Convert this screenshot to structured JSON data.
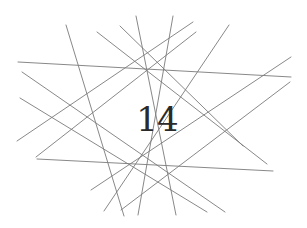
{
  "diagram": {
    "type": "line-arrangement",
    "center_label": "14",
    "line_color": "#7a7a7a",
    "label_color": "#2a2a2a",
    "background": "#ffffff",
    "lines": [
      {
        "x1": 18,
        "y1": 62,
        "x2": 291,
        "y2": 77
      },
      {
        "x1": 37,
        "y1": 159,
        "x2": 273,
        "y2": 171
      },
      {
        "x1": 66,
        "y1": 25,
        "x2": 124,
        "y2": 216
      },
      {
        "x1": 97,
        "y1": 32,
        "x2": 267,
        "y2": 164
      },
      {
        "x1": 120,
        "y1": 26,
        "x2": 243,
        "y2": 146
      },
      {
        "x1": 136,
        "y1": 16,
        "x2": 176,
        "y2": 215
      },
      {
        "x1": 173,
        "y1": 16,
        "x2": 138,
        "y2": 215
      },
      {
        "x1": 229,
        "y1": 25,
        "x2": 104,
        "y2": 211
      },
      {
        "x1": 196,
        "y1": 32,
        "x2": 36,
        "y2": 157
      },
      {
        "x1": 193,
        "y1": 22,
        "x2": 17,
        "y2": 141
      },
      {
        "x1": 291,
        "y1": 57,
        "x2": 91,
        "y2": 190
      },
      {
        "x1": 290,
        "y1": 82,
        "x2": 121,
        "y2": 210
      },
      {
        "x1": 22,
        "y1": 72,
        "x2": 225,
        "y2": 212
      },
      {
        "x1": 20,
        "y1": 98,
        "x2": 207,
        "y2": 212
      }
    ]
  }
}
